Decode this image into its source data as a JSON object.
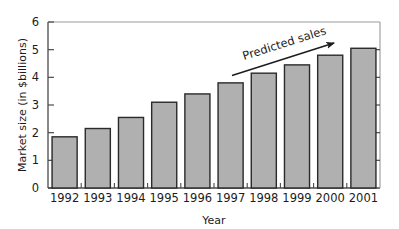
{
  "chart_data": {
    "type": "bar",
    "title": "",
    "xlabel": "Year",
    "ylabel": "Market size (in $billions)",
    "categories": [
      "1992",
      "1993",
      "1994",
      "1995",
      "1996",
      "1997",
      "1998",
      "1999",
      "2000",
      "2001"
    ],
    "values": [
      1.85,
      2.15,
      2.55,
      3.1,
      3.4,
      3.8,
      4.15,
      4.45,
      4.8,
      5.05
    ],
    "ylim": [
      0,
      6
    ],
    "yticks": [
      "0",
      "1",
      "2",
      "3",
      "4",
      "5",
      "6"
    ],
    "ytick_values": [
      0,
      1,
      2,
      3,
      4,
      5,
      6
    ],
    "grid": false,
    "legend": "none",
    "annotations": [
      {
        "text": "Predicted sales",
        "kind": "arrow-label",
        "rotation_deg": -17,
        "covers_categories": [
          "1998",
          "1999",
          "2000",
          "2001"
        ]
      }
    ],
    "colors": {
      "bar_fill": "#b0b0b0",
      "bar_stroke": "#2a2a2a",
      "axis": "#4a4a4a",
      "text": "#1c1c1c",
      "background": "#ffffff",
      "annotation": "#1c1c1c"
    }
  }
}
